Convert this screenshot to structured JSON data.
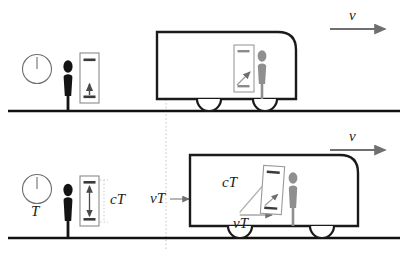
{
  "diagram": {
    "colors": {
      "ink": "#1a1a1a",
      "ground": "#111111",
      "train_outline": "#1a1a1a",
      "observer_rest": "#141414",
      "observer_train": "#8f8f8f",
      "clock_box": "#6e6e6e",
      "mirror": "#3a3a3a",
      "arrow_gray": "#6f6f6f",
      "dotted_guide": "#bbbbbb",
      "bracket": "#c9c9c9"
    },
    "panels": [
      {
        "id": "top-panel",
        "name": "rest-frame-panel",
        "clock_label": "",
        "velocity_label": "v",
        "annotations": []
      },
      {
        "id": "bottom-panel",
        "name": "elapsed-time-panel",
        "clock_label": "T",
        "velocity_label": "v",
        "annotations": [
          "cT",
          "vT",
          "cT",
          "vT"
        ]
      }
    ],
    "labels": {
      "velocity_top": "v",
      "velocity_bottom": "v",
      "period": "T",
      "light_path_rest": "cT",
      "train_displacement_outside": "vT",
      "light_path_moving": "cT",
      "train_displacement_inside": "vT"
    },
    "elements": {
      "analog_clock_top": "clock-face",
      "analog_clock_bottom": "clock-face",
      "light_clock_rest_top": "light-clock",
      "light_clock_rest_bottom": "light-clock",
      "light_clock_train_top": "light-clock",
      "light_clock_train_bottom": "light-clock",
      "observer_ground_top": "person-figure",
      "observer_ground_bottom": "person-figure",
      "observer_train_top": "person-figure",
      "observer_train_bottom": "person-figure",
      "train_top": "train-car",
      "train_bottom": "train-car",
      "ground_top": "ground-line",
      "ground_bottom": "ground-line",
      "guide_line": "vertical-dotted-guide"
    }
  }
}
